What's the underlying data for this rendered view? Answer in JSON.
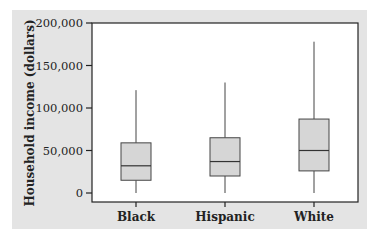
{
  "chart_data": {
    "type": "box",
    "title": "",
    "xlabel": "",
    "ylabel": "Household income (dollars)",
    "ylim": [
      0,
      200000
    ],
    "yticks": [
      0,
      50000,
      100000,
      150000,
      200000
    ],
    "ytick_labels": [
      "0",
      "50,000",
      "100,000",
      "150,000",
      "200,000"
    ],
    "categories": [
      "Black",
      "Hispanic",
      "White"
    ],
    "series": [
      {
        "name": "Black",
        "min": 0,
        "q1": 15000,
        "median": 32000,
        "q3": 59000,
        "max": 121000
      },
      {
        "name": "Hispanic",
        "min": 0,
        "q1": 20000,
        "median": 37000,
        "q3": 65000,
        "max": 130000
      },
      {
        "name": "White",
        "min": 0,
        "q1": 26000,
        "median": 50000,
        "q3": 87000,
        "max": 178000
      }
    ],
    "grid": false,
    "legend": "none",
    "colors": {
      "panel_bg": "#e4e4e4",
      "plot_bg": "#ffffff",
      "box_fill": "#d6d6d6",
      "line": "#333333"
    }
  }
}
